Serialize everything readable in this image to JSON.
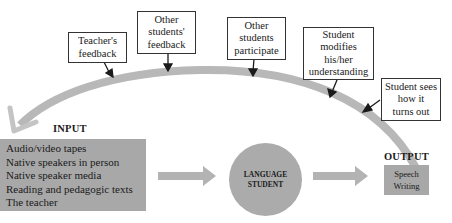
{
  "diagram": {
    "feedback_loop": [
      {
        "id": "teachers-feedback",
        "lines": [
          "Teacher's",
          "feedback"
        ]
      },
      {
        "id": "other-students-feedback",
        "lines": [
          "Other",
          "students'",
          "feedback"
        ]
      },
      {
        "id": "other-students-participate",
        "lines": [
          "Other",
          "students",
          "participate"
        ]
      },
      {
        "id": "student-modifies",
        "lines": [
          "Student",
          "modifies",
          "his/her",
          "understanding"
        ]
      },
      {
        "id": "student-sees",
        "lines": [
          "Student sees",
          "how it",
          "turns out"
        ]
      }
    ],
    "input": {
      "heading": "INPUT",
      "items": [
        "Audio/video tapes",
        "Native speakers in person",
        "Native speaker media",
        "Reading and pedagogic texts",
        "The teacher"
      ]
    },
    "center": {
      "lines": [
        "LANGUAGE",
        "STUDENT"
      ]
    },
    "output": {
      "heading": "OUTPUT",
      "items": [
        "Speech",
        "Writing"
      ]
    },
    "colors": {
      "box_fill": "#a8a8a8",
      "arc": "#b5b5b5",
      "border": "#333333"
    }
  }
}
